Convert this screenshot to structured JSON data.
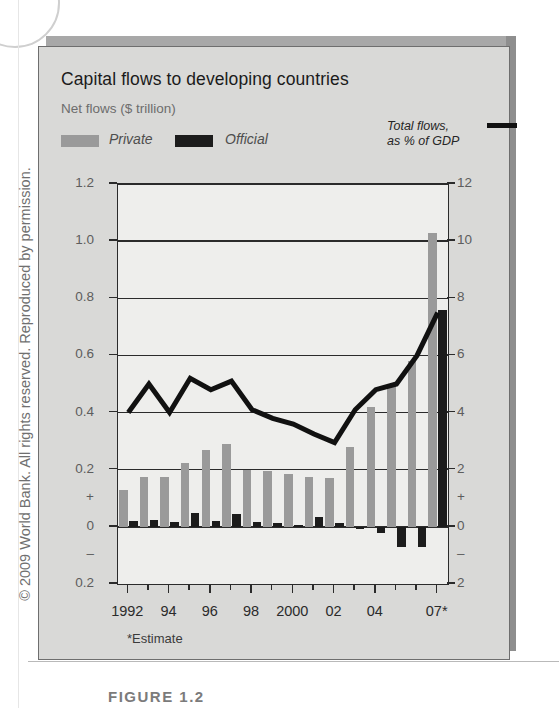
{
  "credit": "© 2009 World Bank. All rights reserved. Reproduced by permission.",
  "caption": "FIGURE 1.2",
  "header": {
    "title": "Capital flows to developing countries",
    "unit": "Net flows ($ trillion)",
    "legend": {
      "private": "Private",
      "official": "Official",
      "line": "Total flows,\nas % of GDP"
    }
  },
  "footnote": "*Estimate",
  "colors": {
    "private": "#9a9a9a",
    "official": "#1c1c1c",
    "line": "#111111",
    "panel": "#eeeeec",
    "frame": "#d9d9d7"
  },
  "chart_data": {
    "type": "bar",
    "title": "Capital flows to developing countries",
    "subtitle": "Net flows ($ trillion)",
    "xlabel": "",
    "ylabel": "Net flows ($ trillion)",
    "y2label": "Total flows, as % of GDP",
    "ylim": [
      -0.2,
      1.2
    ],
    "y2lim": [
      -2,
      12
    ],
    "grid": true,
    "legend_position": "top",
    "x": [
      1992,
      1993,
      1994,
      1995,
      1996,
      1997,
      1998,
      1999,
      2000,
      2001,
      2002,
      2003,
      2004,
      2005,
      2006,
      2007
    ],
    "categories": [
      "1992",
      "1993",
      "1994",
      "1995",
      "1996",
      "1997",
      "1998",
      "1999",
      "2000",
      "2001",
      "2002",
      "2003",
      "2004",
      "2005",
      "2006",
      "07*"
    ],
    "xtick_labels": [
      "1992",
      "",
      "94",
      "",
      "96",
      "",
      "98",
      "",
      "2000",
      "",
      "02",
      "",
      "04",
      "",
      "",
      "07*"
    ],
    "yticks_left": [
      "0.2",
      "0",
      "+",
      "0.2",
      "0.4",
      "0.6",
      "0.8",
      "1.0",
      "1.2"
    ],
    "yticks_left_values": [
      -0.2,
      0,
      0,
      0.2,
      0.4,
      0.6,
      0.8,
      1.0,
      1.2
    ],
    "yticks_right": [
      "2",
      "0",
      "+",
      "2",
      "4",
      "6",
      "8",
      "10",
      "12"
    ],
    "yticks_right_values": [
      -2,
      0,
      0,
      2,
      4,
      6,
      8,
      10,
      12
    ],
    "series": [
      {
        "name": "Private",
        "type": "bar",
        "axis": "left",
        "color": "#9a9a9a",
        "values": [
          0.13,
          0.175,
          0.175,
          0.225,
          0.27,
          0.29,
          0.2,
          0.195,
          0.185,
          0.175,
          0.17,
          0.28,
          0.42,
          0.5,
          0.58,
          1.03
        ]
      },
      {
        "name": "Official",
        "type": "bar",
        "axis": "left",
        "color": "#1c1c1c",
        "values": [
          0.022,
          0.025,
          0.018,
          0.048,
          0.02,
          0.045,
          0.018,
          0.012,
          0.005,
          0.035,
          0.015,
          -0.008,
          -0.02,
          -0.07,
          -0.07,
          0.76
        ]
      },
      {
        "name": "Total flows, as % of GDP",
        "type": "line",
        "axis": "right",
        "color": "#111111",
        "values": [
          4.0,
          5.0,
          4.0,
          5.2,
          4.8,
          5.1,
          4.1,
          3.8,
          3.6,
          3.25,
          2.95,
          4.1,
          4.8,
          5.0,
          6.0,
          7.5
        ]
      }
    ],
    "annotations": [
      "*Estimate"
    ]
  }
}
